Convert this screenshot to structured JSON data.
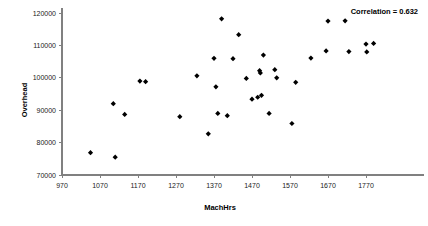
{
  "chart_data": {
    "type": "scatter",
    "title": "",
    "xlabel": "MachHrs",
    "ylabel": "Overhead",
    "xlim": [
      970,
      1820
    ],
    "ylim": [
      70000,
      120000
    ],
    "xticks": [
      970,
      1070,
      1170,
      1270,
      1370,
      1470,
      1570,
      1670,
      1770
    ],
    "yticks": [
      70000,
      80000,
      90000,
      100000,
      110000,
      120000
    ],
    "xtick_labels": [
      "970",
      "1070",
      "1170",
      "1270",
      "1370",
      "1470",
      "1570",
      "1670",
      "1770"
    ],
    "ytick_labels": [
      "70000",
      "80000",
      "90000",
      "100000",
      "110000",
      "120000"
    ],
    "grid": false,
    "legend": "none",
    "marker_color": "#000000",
    "marker_style": "diamond",
    "annotations": [
      {
        "text": "Correlation = 0.632",
        "x": 1740,
        "y": 119500,
        "name": "correlation-annotation"
      }
    ],
    "series": [
      {
        "name": "Overhead vs MachHrs",
        "points": [
          [
            1045,
            76900
          ],
          [
            1105,
            92000
          ],
          [
            1110,
            75500
          ],
          [
            1135,
            88700
          ],
          [
            1175,
            99000
          ],
          [
            1190,
            98800
          ],
          [
            1280,
            88000
          ],
          [
            1325,
            100600
          ],
          [
            1355,
            82700
          ],
          [
            1370,
            106000
          ],
          [
            1375,
            97200
          ],
          [
            1380,
            89000
          ],
          [
            1390,
            118200
          ],
          [
            1405,
            88300
          ],
          [
            1420,
            105900
          ],
          [
            1435,
            113300
          ],
          [
            1455,
            99800
          ],
          [
            1470,
            93400
          ],
          [
            1485,
            94000
          ],
          [
            1490,
            102200
          ],
          [
            1492,
            101500
          ],
          [
            1495,
            94600
          ],
          [
            1500,
            107000
          ],
          [
            1515,
            89000
          ],
          [
            1530,
            102500
          ],
          [
            1535,
            100000
          ],
          [
            1575,
            85900
          ],
          [
            1585,
            98600
          ],
          [
            1625,
            106100
          ],
          [
            1665,
            108300
          ],
          [
            1670,
            117500
          ],
          [
            1715,
            117600
          ],
          [
            1725,
            108100
          ],
          [
            1770,
            110400
          ],
          [
            1772,
            108000
          ],
          [
            1790,
            110600
          ]
        ]
      }
    ]
  },
  "axes": {
    "y_axis_title": "Overhead",
    "x_axis_title": "MachHrs"
  }
}
